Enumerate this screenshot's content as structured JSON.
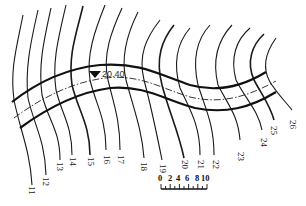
{
  "map": {
    "type": "contour road map",
    "contour_labels": [
      "11",
      "12",
      "13",
      "14",
      "15",
      "16",
      "17",
      "18",
      "19",
      "20",
      "21",
      "22",
      "23",
      "24",
      "25",
      "26"
    ],
    "benchmark": {
      "symbol": "triangle-down",
      "elevation_label": "20.40"
    },
    "scale_bar": {
      "ticks": [
        "0",
        "2",
        "4",
        "6",
        "8",
        "10"
      ]
    },
    "colors": {
      "line": "#1a1a1a",
      "background": "#ffffff"
    }
  }
}
